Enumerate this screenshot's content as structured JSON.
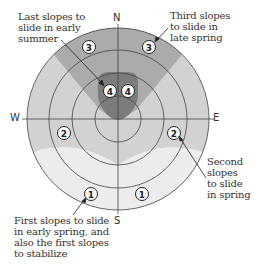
{
  "diagram": {
    "type": "aspect-compass",
    "directions": {
      "north": "N",
      "south": "S",
      "east": "E",
      "west": "W"
    },
    "zones": [
      {
        "number": "1",
        "label": "First slopes to slide in early spring, and also the first slopes to stabilize",
        "color": "#ededed"
      },
      {
        "number": "2",
        "label": "Second slopes to slide in spring",
        "color": "#d4d4d4"
      },
      {
        "number": "3",
        "label": "Third slopes to slide in late spring",
        "color": "#a9a9a9"
      },
      {
        "number": "4",
        "label": "Last slopes to slide in early summer",
        "color": "#7a7a7a"
      }
    ],
    "annotations": {
      "top_left": "Last slopes to\nslide in early\nsummer",
      "top_right": "Third slopes\nto slide in\nlate spring",
      "right": "Second\nslopes\nto slide\nin spring",
      "bottom_left": "First slopes to slide\nin early spring, and\nalso the first slopes\nto stabilize"
    },
    "markers": {
      "one_a": "1",
      "one_b": "1",
      "two_a": "2",
      "two_b": "2",
      "three_a": "3",
      "three_b": "3",
      "four_a": "4",
      "four_b": "4"
    }
  }
}
